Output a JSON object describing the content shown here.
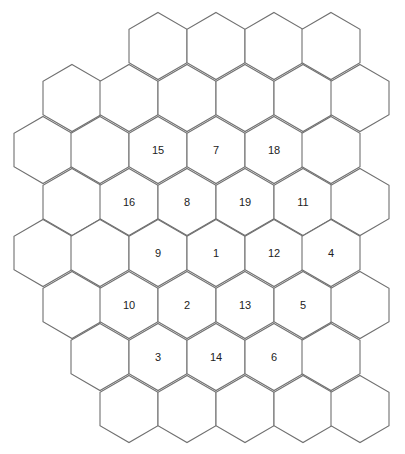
{
  "diagram": {
    "hex": {
      "radius": 33.5,
      "orientation": "pointy-top",
      "stroke": "#707070",
      "fill": "#ffffff",
      "label_color": "#222222"
    },
    "cells": [
      {
        "x": 158,
        "y": 46,
        "label": ""
      },
      {
        "x": 216,
        "y": 46,
        "label": ""
      },
      {
        "x": 274,
        "y": 46,
        "label": ""
      },
      {
        "x": 331,
        "y": 46,
        "label": ""
      },
      {
        "x": 72,
        "y": 98,
        "label": ""
      },
      {
        "x": 129,
        "y": 98,
        "label": ""
      },
      {
        "x": 187,
        "y": 98,
        "label": ""
      },
      {
        "x": 245,
        "y": 98,
        "label": ""
      },
      {
        "x": 303,
        "y": 98,
        "label": ""
      },
      {
        "x": 360,
        "y": 98,
        "label": ""
      },
      {
        "x": 43,
        "y": 150,
        "label": ""
      },
      {
        "x": 100,
        "y": 150,
        "label": ""
      },
      {
        "x": 158,
        "y": 150,
        "label": "15"
      },
      {
        "x": 216,
        "y": 150,
        "label": "7"
      },
      {
        "x": 274,
        "y": 150,
        "label": "18"
      },
      {
        "x": 331,
        "y": 150,
        "label": ""
      },
      {
        "x": 72,
        "y": 202,
        "label": ""
      },
      {
        "x": 129,
        "y": 202,
        "label": "16"
      },
      {
        "x": 187,
        "y": 202,
        "label": "8"
      },
      {
        "x": 245,
        "y": 202,
        "label": "19"
      },
      {
        "x": 303,
        "y": 202,
        "label": "11"
      },
      {
        "x": 360,
        "y": 202,
        "label": ""
      },
      {
        "x": 43,
        "y": 253,
        "label": ""
      },
      {
        "x": 100,
        "y": 253,
        "label": ""
      },
      {
        "x": 158,
        "y": 253,
        "label": "9"
      },
      {
        "x": 216,
        "y": 253,
        "label": "1"
      },
      {
        "x": 274,
        "y": 253,
        "label": "12"
      },
      {
        "x": 331,
        "y": 253,
        "label": "4"
      },
      {
        "x": 72,
        "y": 305,
        "label": ""
      },
      {
        "x": 129,
        "y": 305,
        "label": "10"
      },
      {
        "x": 187,
        "y": 305,
        "label": "2"
      },
      {
        "x": 245,
        "y": 305,
        "label": "13"
      },
      {
        "x": 303,
        "y": 305,
        "label": "5"
      },
      {
        "x": 360,
        "y": 305,
        "label": ""
      },
      {
        "x": 100,
        "y": 357,
        "label": ""
      },
      {
        "x": 158,
        "y": 357,
        "label": "3"
      },
      {
        "x": 216,
        "y": 357,
        "label": "14"
      },
      {
        "x": 274,
        "y": 357,
        "label": "6"
      },
      {
        "x": 331,
        "y": 357,
        "label": ""
      },
      {
        "x": 129,
        "y": 409,
        "label": ""
      },
      {
        "x": 187,
        "y": 409,
        "label": ""
      },
      {
        "x": 245,
        "y": 409,
        "label": ""
      },
      {
        "x": 303,
        "y": 409,
        "label": ""
      },
      {
        "x": 360,
        "y": 409,
        "label": ""
      }
    ]
  }
}
